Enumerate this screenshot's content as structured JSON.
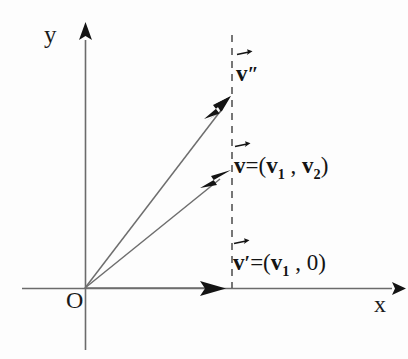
{
  "diagram": {
    "background_color": "#fdfdfd",
    "line_color": "#5a5a5a",
    "text_color": "#141414",
    "axes": {
      "y_label": "y",
      "x_label": "x",
      "origin_label": "O",
      "x_axis": {
        "x_start": 22,
        "x_end": 398,
        "y": 288
      },
      "y_axis": {
        "x": 85,
        "y_start": 30,
        "y_end": 350
      }
    },
    "dashed_line": {
      "x": 232,
      "y_top": 35,
      "y_bottom": 288,
      "meaning": "vertical line x = v1"
    },
    "vectors": [
      {
        "name": "v-double-prime",
        "label_v": "v",
        "label_prime": "″",
        "label_equation": "",
        "from": [
          85,
          288
        ],
        "to": [
          231,
          97
        ],
        "has_arrow_accent": true
      },
      {
        "name": "v",
        "label_v": "v",
        "label_prime": "",
        "label_equation": "=(v₁ , v₂)",
        "equation_open": "=(",
        "equation_v1": "v",
        "equation_v1_sub": "1",
        "equation_sep": " , ",
        "equation_v2": "v",
        "equation_v2_sub": "2",
        "equation_close": ")",
        "from": [
          85,
          288
        ],
        "to": [
          231,
          170
        ],
        "has_arrow_accent": true
      },
      {
        "name": "v-prime",
        "label_v": "v",
        "label_prime": "′",
        "label_equation": "=(v₁ , 0)",
        "equation_open": "=(",
        "equation_v1": "v",
        "equation_v1_sub": "1",
        "equation_sep": " , ",
        "equation_zero": "0",
        "equation_close": ")",
        "from": [
          85,
          288
        ],
        "to": [
          225,
          288
        ],
        "has_arrow_accent": true
      }
    ]
  }
}
